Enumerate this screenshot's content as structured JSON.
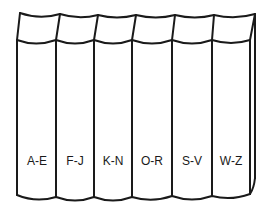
{
  "diagram": {
    "volume_count": 6,
    "volumes": [
      {
        "label": "A-E"
      },
      {
        "label": "F-J"
      },
      {
        "label": "K-N"
      },
      {
        "label": "O-R"
      },
      {
        "label": "S-V"
      },
      {
        "label": "W-Z"
      }
    ],
    "colors": {
      "stroke": "#1a1a1a",
      "background": "#ffffff"
    }
  }
}
